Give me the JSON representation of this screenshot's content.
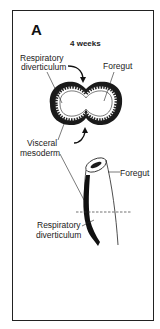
{
  "figure": {
    "panel_letter": "A",
    "stage_label": "4 weeks",
    "labels": {
      "respiratory_diverticulum_top_line1": "Respiratory",
      "respiratory_diverticulum_top_line2": "diverticulum",
      "foregut_top": "Foregut",
      "visceral_mesoderm_line1": "Visceral",
      "visceral_mesoderm_line2": "mesoderm",
      "foregut_bottom": "Foregut",
      "respiratory_diverticulum_bottom_line1": "Respiratory",
      "respiratory_diverticulum_bottom_line2": "diverticulum"
    },
    "colors": {
      "ink": "#111111",
      "background": "#ffffff",
      "mesoderm": "#1a1a1a"
    }
  }
}
